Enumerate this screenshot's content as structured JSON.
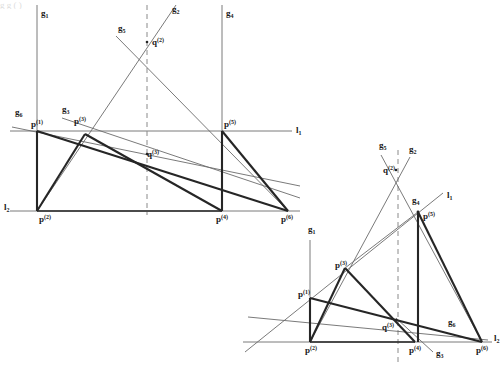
{
  "figure": {
    "background": "#ffffff",
    "stroke_thin": "#5a5a5a",
    "stroke_thick": "#2b2b2b",
    "dash_color": "#7a7a7a",
    "label_color": "#1a1a1a",
    "cropped_top_text": "g  g  (        )",
    "panels": [
      {
        "name": "left-configuration",
        "labels": [
          {
            "id": "g1",
            "base": "g",
            "sub": "1",
            "sup": "",
            "x": 41,
            "y": 16
          },
          {
            "id": "g2",
            "base": "g",
            "sub": "2",
            "sup": "",
            "x": 172,
            "y": 12
          },
          {
            "id": "g5",
            "base": "g",
            "sub": "5",
            "sup": "",
            "x": 118,
            "y": 31
          },
          {
            "id": "g4",
            "base": "g",
            "sub": "4",
            "sup": "",
            "x": 226,
            "y": 16
          },
          {
            "id": "g3",
            "base": "g",
            "sub": "3",
            "sup": "",
            "x": 62,
            "y": 112
          },
          {
            "id": "g6",
            "base": "g",
            "sub": "6",
            "sup": "",
            "x": 15,
            "y": 115
          },
          {
            "id": "l1",
            "base": "l",
            "sub": "1",
            "sup": "",
            "x": 296,
            "y": 133
          },
          {
            "id": "l2",
            "base": "l",
            "sub": "2",
            "sup": "",
            "x": 4,
            "y": 210
          },
          {
            "id": "q2",
            "base": "q",
            "sub": "",
            "sup": "(2)",
            "x": 152,
            "y": 45
          },
          {
            "id": "q3",
            "base": "q",
            "sub": "",
            "sup": "(3)",
            "x": 147,
            "y": 157
          },
          {
            "id": "p1",
            "base": "p",
            "sub": "",
            "sup": "(1)",
            "x": 31,
            "y": 127
          },
          {
            "id": "p2",
            "base": "p",
            "sub": "",
            "sup": "(2)",
            "x": 39,
            "y": 222
          },
          {
            "id": "p3",
            "base": "p",
            "sub": "",
            "sup": "(3)",
            "x": 74,
            "y": 124
          },
          {
            "id": "p4",
            "base": "p",
            "sub": "",
            "sup": "(4)",
            "x": 216,
            "y": 222
          },
          {
            "id": "p5",
            "base": "p",
            "sub": "",
            "sup": "(5)",
            "x": 224,
            "y": 127
          },
          {
            "id": "p6",
            "base": "p",
            "sub": "",
            "sup": "(6)",
            "x": 281,
            "y": 222
          }
        ]
      },
      {
        "name": "right-configuration",
        "labels": [
          {
            "id": "g5r",
            "base": "g",
            "sub": "5",
            "sup": "",
            "x": 379,
            "y": 148
          },
          {
            "id": "g2r",
            "base": "g",
            "sub": "2",
            "sup": "",
            "x": 409,
            "y": 152
          },
          {
            "id": "g4r",
            "base": "g",
            "sub": "4",
            "sup": "",
            "x": 412,
            "y": 203
          },
          {
            "id": "l1r",
            "base": "l",
            "sub": "1",
            "sup": "",
            "x": 447,
            "y": 198
          },
          {
            "id": "g1r",
            "base": "g",
            "sub": "1",
            "sup": "",
            "x": 308,
            "y": 232
          },
          {
            "id": "g6r",
            "base": "g",
            "sub": "6",
            "sup": "",
            "x": 448,
            "y": 325
          },
          {
            "id": "g3r",
            "base": "g",
            "sub": "3",
            "sup": "",
            "x": 436,
            "y": 356
          },
          {
            "id": "l2r",
            "base": "l",
            "sub": "2",
            "sup": "",
            "x": 494,
            "y": 341
          },
          {
            "id": "q2r",
            "base": "q",
            "sub": "",
            "sup": "(2)",
            "x": 383,
            "y": 173
          },
          {
            "id": "q3r",
            "base": "q",
            "sub": "",
            "sup": "(3)",
            "x": 382,
            "y": 330
          },
          {
            "id": "p5r",
            "base": "p",
            "sub": "",
            "sup": "(5)",
            "x": 423,
            "y": 219
          },
          {
            "id": "p3r",
            "base": "p",
            "sub": "",
            "sup": "(3)",
            "x": 335,
            "y": 268
          },
          {
            "id": "p1r",
            "base": "p",
            "sub": "",
            "sup": "(1)",
            "x": 298,
            "y": 297
          },
          {
            "id": "p2r",
            "base": "p",
            "sub": "",
            "sup": "(2)",
            "x": 305,
            "y": 353
          },
          {
            "id": "p4r",
            "base": "p",
            "sub": "",
            "sup": "(4)",
            "x": 409,
            "y": 353
          },
          {
            "id": "p6r",
            "base": "p",
            "sub": "",
            "sup": "(6)",
            "x": 476,
            "y": 353
          }
        ]
      }
    ]
  },
  "geometry": {
    "left": {
      "points": {
        "p1": [
          37,
          131
        ],
        "p2": [
          37,
          211
        ],
        "p3": [
          85,
          134
        ],
        "p4": [
          222,
          211
        ],
        "p5": [
          222,
          131
        ],
        "p6": [
          288,
          211
        ],
        "q2": [
          147,
          42
        ],
        "q3": [
          147,
          154
        ]
      },
      "line_l1_y": 131,
      "line_l2_y": 211,
      "dash_x": 147,
      "vertical_g1_x": 37,
      "vertical_g4_x": 222
    },
    "right": {
      "points": {
        "p1": [
          310,
          298
        ],
        "p2": [
          310,
          342
        ],
        "p3": [
          345,
          268
        ],
        "p4": [
          415,
          342
        ],
        "p5": [
          418,
          212
        ],
        "p6": [
          482,
          342
        ],
        "q2": [
          396,
          170
        ],
        "q3": [
          396,
          320
        ]
      },
      "line_l2_y": 342,
      "dash_x": 398,
      "vertical_g1_x": 310,
      "vertical_g4_x": 418
    }
  }
}
